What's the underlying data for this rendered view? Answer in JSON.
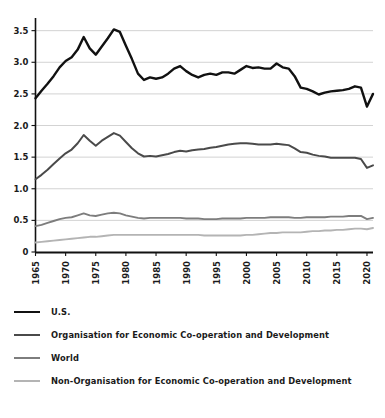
{
  "chart_data": {
    "type": "line",
    "title": "",
    "xlabel": "",
    "ylabel": "",
    "xlim": [
      1965,
      2021
    ],
    "ylim": [
      0,
      3.7
    ],
    "grid": true,
    "legend_position": "bottom",
    "y_ticks": [
      "0",
      "0.5",
      "1.0",
      "1.5",
      "2.0",
      "2.5",
      "3.0",
      "3.5"
    ],
    "y_tick_values": [
      0,
      0.5,
      1.0,
      1.5,
      2.0,
      2.5,
      3.0,
      3.5
    ],
    "x_ticks": [
      "1965",
      "1970",
      "1975",
      "1980",
      "1985",
      "1990",
      "1995",
      "2000",
      "2005",
      "2010",
      "2015",
      "2020"
    ],
    "x_tick_values": [
      1965,
      1970,
      1975,
      1980,
      1985,
      1990,
      1995,
      2000,
      2005,
      2010,
      2015,
      2020
    ],
    "x": [
      1965,
      1966,
      1967,
      1968,
      1969,
      1970,
      1971,
      1972,
      1973,
      1974,
      1975,
      1976,
      1977,
      1978,
      1979,
      1980,
      1981,
      1982,
      1983,
      1984,
      1985,
      1986,
      1987,
      1988,
      1989,
      1990,
      1991,
      1992,
      1993,
      1994,
      1995,
      1996,
      1997,
      1998,
      1999,
      2000,
      2001,
      2002,
      2003,
      2004,
      2005,
      2006,
      2007,
      2008,
      2009,
      2010,
      2011,
      2012,
      2013,
      2014,
      2015,
      2016,
      2017,
      2018,
      2019,
      2020,
      2021
    ],
    "series": [
      {
        "name": "U.S.",
        "color": "#111111",
        "width": 2.4,
        "values": [
          2.43,
          2.55,
          2.66,
          2.78,
          2.92,
          3.02,
          3.08,
          3.2,
          3.4,
          3.22,
          3.12,
          3.25,
          3.38,
          3.52,
          3.48,
          3.26,
          3.05,
          2.82,
          2.72,
          2.76,
          2.74,
          2.76,
          2.82,
          2.9,
          2.94,
          2.86,
          2.8,
          2.76,
          2.8,
          2.82,
          2.8,
          2.84,
          2.84,
          2.82,
          2.88,
          2.94,
          2.91,
          2.92,
          2.9,
          2.9,
          2.98,
          2.92,
          2.9,
          2.78,
          2.6,
          2.58,
          2.54,
          2.49,
          2.52,
          2.54,
          2.55,
          2.56,
          2.58,
          2.62,
          2.6,
          2.3,
          2.5
        ]
      },
      {
        "name": "Organisation for Economic Co-operation and Development",
        "color": "#4a4a4a",
        "width": 2.0,
        "values": [
          1.15,
          1.22,
          1.3,
          1.39,
          1.48,
          1.56,
          1.62,
          1.72,
          1.85,
          1.76,
          1.68,
          1.76,
          1.82,
          1.88,
          1.84,
          1.74,
          1.64,
          1.56,
          1.51,
          1.52,
          1.51,
          1.53,
          1.55,
          1.58,
          1.6,
          1.59,
          1.61,
          1.62,
          1.63,
          1.65,
          1.66,
          1.68,
          1.7,
          1.71,
          1.72,
          1.72,
          1.71,
          1.7,
          1.7,
          1.7,
          1.71,
          1.7,
          1.69,
          1.64,
          1.58,
          1.57,
          1.54,
          1.52,
          1.51,
          1.49,
          1.49,
          1.49,
          1.49,
          1.49,
          1.47,
          1.33,
          1.37
        ]
      },
      {
        "name": "World",
        "color": "#7d7d7d",
        "width": 1.9,
        "values": [
          0.41,
          0.43,
          0.46,
          0.49,
          0.52,
          0.54,
          0.55,
          0.58,
          0.61,
          0.58,
          0.57,
          0.59,
          0.61,
          0.62,
          0.61,
          0.58,
          0.56,
          0.54,
          0.53,
          0.54,
          0.54,
          0.54,
          0.54,
          0.54,
          0.54,
          0.53,
          0.53,
          0.53,
          0.52,
          0.52,
          0.52,
          0.53,
          0.53,
          0.53,
          0.53,
          0.54,
          0.54,
          0.54,
          0.54,
          0.55,
          0.55,
          0.55,
          0.55,
          0.54,
          0.54,
          0.55,
          0.55,
          0.55,
          0.55,
          0.56,
          0.56,
          0.56,
          0.57,
          0.57,
          0.57,
          0.52,
          0.54
        ]
      },
      {
        "name": "Non-Organisation for Economic Co-operation and Development",
        "color": "#b4b4b4",
        "width": 1.9,
        "values": [
          0.15,
          0.16,
          0.17,
          0.18,
          0.19,
          0.2,
          0.21,
          0.22,
          0.23,
          0.24,
          0.24,
          0.25,
          0.26,
          0.27,
          0.27,
          0.27,
          0.27,
          0.27,
          0.27,
          0.27,
          0.27,
          0.27,
          0.27,
          0.27,
          0.27,
          0.27,
          0.27,
          0.27,
          0.26,
          0.26,
          0.26,
          0.26,
          0.26,
          0.26,
          0.26,
          0.27,
          0.27,
          0.28,
          0.29,
          0.3,
          0.3,
          0.31,
          0.31,
          0.31,
          0.31,
          0.32,
          0.33,
          0.33,
          0.34,
          0.34,
          0.35,
          0.35,
          0.36,
          0.37,
          0.37,
          0.36,
          0.38
        ]
      }
    ]
  },
  "legend": {
    "items": [
      {
        "label": "U.S.",
        "color": "#111111",
        "thickness": 2.6
      },
      {
        "label": "Organisation for Economic Co-operation and Development",
        "color": "#4a4a4a",
        "thickness": 2.2
      },
      {
        "label": "World",
        "color": "#7d7d7d",
        "thickness": 2.0
      },
      {
        "label": "Non-Organisation for Economic Co-operation and Development",
        "color": "#b4b4b4",
        "thickness": 2.0
      }
    ]
  },
  "axes": {
    "axis_color": "#111111",
    "grid_color": "#c8c8c8"
  }
}
